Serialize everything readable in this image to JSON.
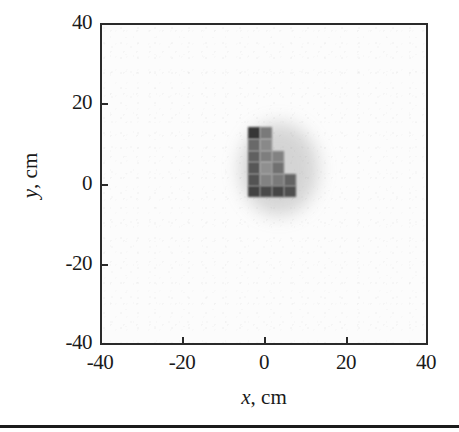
{
  "figure": {
    "type": "grayscale-image-plot",
    "bottom_rule": true
  },
  "axes": {
    "x": {
      "label_prefix": "x",
      "label_suffix": ", cm",
      "label_full": "x, cm",
      "ticks": [
        "-40",
        "-20",
        "0",
        "20",
        "40"
      ],
      "tick_values": [
        -40,
        -20,
        0,
        20,
        40
      ],
      "range": [
        -40,
        40
      ]
    },
    "y": {
      "label_prefix": "y",
      "label_suffix": ", cm",
      "label_full": "y, cm",
      "ticks": [
        "40",
        "20",
        "0",
        "-20",
        "-40"
      ],
      "tick_values": [
        40,
        20,
        0,
        -20,
        -40
      ],
      "range": [
        -40,
        40
      ]
    }
  },
  "colors": {
    "background": "#ffffff",
    "panel": "#fcfcfc",
    "frame": "#2a2a2a",
    "text": "#1a1a1a",
    "rule": "#1b1b1b",
    "data_dark": "#2b2b2b",
    "data_mid": "#5a5a5a",
    "data_light": "#8d8d8d"
  },
  "chart_data": {
    "type": "heatmap",
    "title": "",
    "xlabel": "x, cm",
    "ylabel": "y, cm",
    "xlim": [
      -40,
      40
    ],
    "ylim": [
      -40,
      40
    ],
    "grid": false,
    "legend": "none",
    "colormap": "grayscale-inverted",
    "value_range": [
      0,
      1
    ],
    "background_value": 0.03,
    "cell_size_cm": 2.9,
    "cells": [
      {
        "x": -4.4,
        "y": 11.7,
        "w": 2.9,
        "h": 2.9,
        "value": 0.93
      },
      {
        "x": -1.5,
        "y": 11.7,
        "w": 2.9,
        "h": 2.9,
        "value": 0.62
      },
      {
        "x": -4.4,
        "y": 8.8,
        "w": 2.9,
        "h": 2.9,
        "value": 0.7
      },
      {
        "x": -1.5,
        "y": 8.8,
        "w": 2.9,
        "h": 2.9,
        "value": 0.55
      },
      {
        "x": -4.4,
        "y": 5.9,
        "w": 2.9,
        "h": 2.9,
        "value": 0.74
      },
      {
        "x": -1.5,
        "y": 5.9,
        "w": 2.9,
        "h": 2.9,
        "value": 0.6
      },
      {
        "x": 1.4,
        "y": 5.9,
        "w": 2.9,
        "h": 2.9,
        "value": 0.58
      },
      {
        "x": -4.4,
        "y": 3.0,
        "w": 2.9,
        "h": 2.9,
        "value": 0.78
      },
      {
        "x": -1.5,
        "y": 3.0,
        "w": 2.9,
        "h": 2.9,
        "value": 0.52
      },
      {
        "x": 1.4,
        "y": 3.0,
        "w": 2.9,
        "h": 2.9,
        "value": 0.66
      },
      {
        "x": -4.4,
        "y": 0.1,
        "w": 2.9,
        "h": 2.9,
        "value": 0.8
      },
      {
        "x": -1.5,
        "y": 0.1,
        "w": 2.9,
        "h": 2.9,
        "value": 0.58
      },
      {
        "x": 1.4,
        "y": 0.1,
        "w": 2.9,
        "h": 2.9,
        "value": 0.62
      },
      {
        "x": 4.3,
        "y": 0.1,
        "w": 2.9,
        "h": 2.9,
        "value": 0.72
      },
      {
        "x": -4.4,
        "y": -2.8,
        "w": 2.9,
        "h": 2.9,
        "value": 0.88
      },
      {
        "x": -1.5,
        "y": -2.8,
        "w": 2.9,
        "h": 2.9,
        "value": 0.84
      },
      {
        "x": 1.4,
        "y": -2.8,
        "w": 2.9,
        "h": 2.9,
        "value": 0.86
      },
      {
        "x": 4.3,
        "y": -2.8,
        "w": 2.9,
        "h": 2.9,
        "value": 0.82
      }
    ]
  }
}
